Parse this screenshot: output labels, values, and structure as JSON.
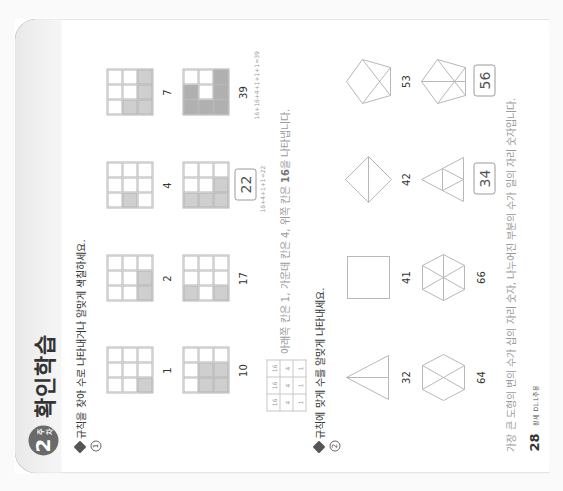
{
  "page": {
    "orientation": "rotated-90-ccw",
    "week_badge": {
      "number": "2",
      "unit": "주차"
    },
    "title": "확인학습",
    "page_number": "28",
    "brand": "팡세 D1.1주용"
  },
  "problem1": {
    "number": "1",
    "instruction": "규칙을 찾아 수로 나타내거나 알맞게 색칠하세요.",
    "cell_values": [
      [
        16,
        16,
        16
      ],
      [
        4,
        4,
        4
      ],
      [
        1,
        1,
        1
      ]
    ],
    "items": [
      {
        "value": "1",
        "shaded": [
          [
            2,
            0
          ]
        ],
        "is_answer": false
      },
      {
        "value": "2",
        "shaded": [
          [
            2,
            0
          ],
          [
            2,
            1
          ]
        ],
        "is_answer": false
      },
      {
        "value": "4",
        "shaded": [
          [
            1,
            0
          ]
        ],
        "is_answer": false
      },
      {
        "value": "7",
        "shaded": [
          [
            1,
            0
          ],
          [
            2,
            0
          ],
          [
            2,
            1
          ],
          [
            2,
            2
          ]
        ],
        "is_answer": false
      },
      {
        "value": "10",
        "shaded": [
          [
            1,
            0
          ],
          [
            1,
            1
          ],
          [
            2,
            0
          ],
          [
            2,
            1
          ]
        ],
        "is_answer": false
      },
      {
        "value": "17",
        "shaded": [
          [
            0,
            0
          ],
          [
            2,
            0
          ]
        ],
        "is_answer": false
      },
      {
        "value": "22",
        "shaded": [
          [
            0,
            0
          ],
          [
            1,
            0
          ],
          [
            2,
            0
          ],
          [
            2,
            1
          ]
        ],
        "is_answer": true,
        "work": "16+4+1+1=22"
      },
      {
        "value": "39",
        "shaded": [
          [
            0,
            0
          ],
          [
            0,
            1
          ],
          [
            1,
            0
          ],
          [
            2,
            0
          ],
          [
            2,
            1
          ],
          [
            2,
            2
          ]
        ],
        "is_answer": false,
        "dark": true,
        "work": "16+16+4+1+1+1=39"
      }
    ],
    "key_table": [
      [
        "16",
        "16",
        "16"
      ],
      [
        "4",
        "4",
        "4"
      ],
      [
        "1",
        "1",
        "1"
      ]
    ],
    "explanation_prefix": "아래쪽 칸은 1, 가운데 칸은 4, 위쪽 칸은 ",
    "explanation_bold": "16",
    "explanation_suffix": "을 나타냅니다."
  },
  "problem2": {
    "number": "2",
    "instruction": "규칙에 맞게 수를 알맞게 나타내세요.",
    "items": [
      {
        "shape": "triangle-split",
        "value": "32",
        "is_answer": false
      },
      {
        "shape": "square",
        "value": "41",
        "is_answer": false
      },
      {
        "shape": "diamond-split",
        "value": "42",
        "is_answer": false
      },
      {
        "shape": "pentagon-3",
        "value": "53",
        "is_answer": false
      },
      {
        "shape": "hexagon-4",
        "value": "64",
        "is_answer": false
      },
      {
        "shape": "hexagon-6",
        "value": "66",
        "is_answer": false
      },
      {
        "shape": "triangle-4",
        "value": "34",
        "is_answer": true
      },
      {
        "shape": "pentagon-6",
        "value": "56",
        "is_answer": true
      }
    ],
    "explanation": "가장 큰 도형의 변의 수가 십의 자리 숫자, 나누어진 부분의 수가 일의 자리 숫자입니다."
  },
  "colors": {
    "shade": "#cfcfcf",
    "shade_dark": "#b0b0b0",
    "line": "#b5b5b5",
    "badge": "#6a6a6a",
    "hint_text": "#9a9a9a"
  }
}
